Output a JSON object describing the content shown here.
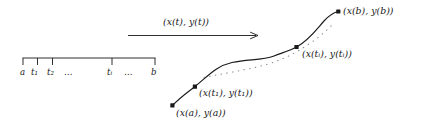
{
  "figure": {
    "background_color": "#ffffff",
    "ink_color": "#1a1a1a",
    "domain_axis": {
      "name": "interval-bracket",
      "start_label": "a",
      "end_label": "b",
      "tick_labels": [
        "a",
        "t₁",
        "t₂",
        "…",
        "tᵢ",
        "…",
        "b"
      ],
      "labels": {
        "a": "a",
        "t1": "t₁",
        "t2": "t₂",
        "ellipsis_left": "…",
        "ti": "tᵢ",
        "ellipsis_right": "…",
        "b": "b"
      }
    },
    "mapping_arrow": {
      "label": "(x(t), y(t))"
    },
    "curve_points": {
      "start": "(x(a), y(a))",
      "first": "(x(t₁), y(t₁))",
      "middle": "(x(tᵢ), y(tᵢ))",
      "end": "(x(b), y(b))"
    }
  }
}
